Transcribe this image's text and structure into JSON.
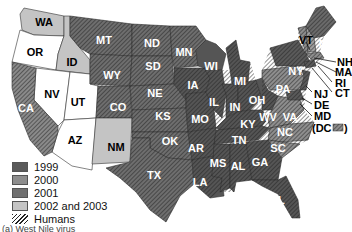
{
  "legend": {
    "items": [
      {
        "label": "1999",
        "color": "#5a5a5a"
      },
      {
        "label": "2000",
        "color": "#8e8e8e"
      },
      {
        "label": "2001",
        "color": "#707070"
      },
      {
        "label": "2002 and 2003",
        "color": "#c4c4c4"
      },
      {
        "label": "Humans",
        "pattern": "hatch"
      }
    ]
  },
  "states": {
    "WA": {
      "label": "WA",
      "category": "2002 and 2003",
      "humans": false
    },
    "OR": {
      "label": "OR",
      "category": "none",
      "humans": false
    },
    "ID": {
      "label": "ID",
      "category": "2002 and 2003",
      "humans": false
    },
    "NV": {
      "label": "NV",
      "category": "none",
      "humans": false
    },
    "UT": {
      "label": "UT",
      "category": "none",
      "humans": false
    },
    "AZ": {
      "label": "AZ",
      "category": "none",
      "humans": false
    },
    "CA": {
      "label": "CA",
      "category": "2002 and 2003",
      "humans": true
    },
    "MT": {
      "label": "MT",
      "category": "2002 and 2003",
      "humans": true
    },
    "WY": {
      "label": "WY",
      "category": "2002 and 2003",
      "humans": true
    },
    "CO": {
      "label": "CO",
      "category": "2002 and 2003",
      "humans": true
    },
    "NM": {
      "label": "NM",
      "category": "2002 and 2003",
      "humans": false
    },
    "ND": {
      "label": "ND",
      "category": "2002 and 2003",
      "humans": true
    },
    "SD": {
      "label": "SD",
      "category": "2002 and 2003",
      "humans": true
    },
    "NE": {
      "label": "NE",
      "category": "2002 and 2003",
      "humans": true
    },
    "KS": {
      "label": "KS",
      "category": "2002 and 2003",
      "humans": true
    },
    "OK": {
      "label": "OK",
      "category": "2002 and 2003",
      "humans": true
    },
    "TX": {
      "label": "TX",
      "category": "2002 and 2003",
      "humans": true
    },
    "MN": {
      "label": "MN",
      "category": "2002 and 2003",
      "humans": true
    },
    "IA": {
      "label": "IA",
      "category": "2001",
      "humans": true
    },
    "MO": {
      "label": "MO",
      "category": "2001",
      "humans": true
    },
    "AR": {
      "label": "AR",
      "category": "2001",
      "humans": true
    },
    "LA": {
      "label": "LA",
      "category": "2001",
      "humans": true
    },
    "WI": {
      "label": "WI",
      "category": "2001",
      "humans": true
    },
    "IL": {
      "label": "IL",
      "category": "2001",
      "humans": true
    },
    "MI": {
      "label": "MI",
      "category": "2001",
      "humans": true
    },
    "IN": {
      "label": "IN",
      "category": "2001",
      "humans": true
    },
    "OH": {
      "label": "OH",
      "category": "2001",
      "humans": true
    },
    "KY": {
      "label": "KY",
      "category": "2001",
      "humans": true
    },
    "TN": {
      "label": "TN",
      "category": "2001",
      "humans": true
    },
    "MS": {
      "label": "MS",
      "category": "2001",
      "humans": true
    },
    "AL": {
      "label": "AL",
      "category": "2001",
      "humans": true
    },
    "GA": {
      "label": "GA",
      "category": "2001",
      "humans": true
    },
    "FL": {
      "label": "FL",
      "category": "2001",
      "humans": true
    },
    "SC": {
      "label": "SC",
      "category": "2000",
      "humans": true
    },
    "NC": {
      "label": "NC",
      "category": "2000",
      "humans": true
    },
    "VA": {
      "label": "VA",
      "category": "2000",
      "humans": true
    },
    "WV": {
      "label": "WV",
      "category": "2001",
      "humans": true
    },
    "PA": {
      "label": "PA",
      "category": "2000",
      "humans": true
    },
    "NY": {
      "label": "NY",
      "category": "1999",
      "humans": true
    },
    "VT": {
      "label": "VT",
      "category": "2000",
      "humans": true
    },
    "NH": {
      "label": "NH",
      "category": "2000",
      "humans": false
    },
    "ME": {
      "label": "ME",
      "category": "2001",
      "humans": true
    },
    "MA": {
      "label": "MA",
      "category": "2000",
      "humans": true
    },
    "RI": {
      "label": "RI",
      "category": "2000",
      "humans": true
    },
    "CT": {
      "label": "CT",
      "category": "1999",
      "humans": true
    },
    "NJ": {
      "label": "NJ",
      "category": "1999",
      "humans": true
    },
    "DE": {
      "label": "DE",
      "category": "2000",
      "humans": true
    },
    "MD": {
      "label": "MD",
      "category": "1999",
      "humans": true
    },
    "DC": {
      "label": "(DC",
      "close": ")",
      "category": "2000",
      "humans": true
    }
  },
  "caption": "(a) West Nile virus"
}
